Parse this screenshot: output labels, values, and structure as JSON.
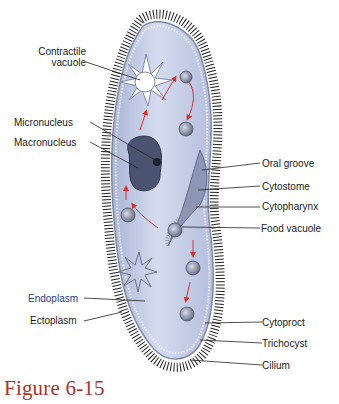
{
  "figure": {
    "caption": "Figure 6-15"
  },
  "labels_left": [
    {
      "id": "contractile-vacuole",
      "text_line1": "Contractile",
      "text_line2": "vacuole"
    },
    {
      "id": "micronucleus",
      "text": "Micronucleus"
    },
    {
      "id": "macronucleus",
      "text": "Macronucleus"
    },
    {
      "id": "endoplasm",
      "text": "Endoplasm"
    },
    {
      "id": "ectoplasm",
      "text": "Ectoplasm"
    }
  ],
  "labels_right": [
    {
      "id": "oral-groove",
      "text": "Oral groove"
    },
    {
      "id": "cytostome",
      "text": "Cytostome"
    },
    {
      "id": "cytopharynx",
      "text": "Cytopharynx"
    },
    {
      "id": "food-vacuole",
      "text": "Food vacuole"
    },
    {
      "id": "cytoproct",
      "text": "Cytoproct"
    },
    {
      "id": "trichocyst",
      "text": "Trichocyst"
    },
    {
      "id": "cilium",
      "text": "Cilium"
    }
  ],
  "colors": {
    "cell_fill": "#c9d2ea",
    "cell_edge": "#7f8aa8",
    "cilia": "#333333",
    "macronucleus": "#4a5470",
    "arrow": "#d8342a",
    "caption": "#b0302a",
    "blue_label": "#2b3a8a"
  }
}
